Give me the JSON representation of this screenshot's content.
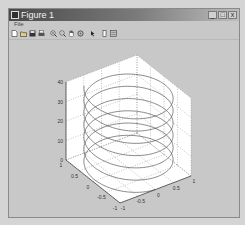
{
  "window": {
    "title": "Figure 1",
    "controls": {
      "minimize": "_",
      "maximize": "□",
      "close": "x"
    }
  },
  "menu": {
    "items": [
      {
        "label": "File"
      }
    ]
  },
  "toolbar": {
    "buttons": [
      {
        "name": "new-figure",
        "icon": "new-file-icon"
      },
      {
        "name": "open-file",
        "icon": "open-folder-icon"
      },
      {
        "name": "save-figure",
        "icon": "save-icon"
      },
      {
        "name": "print-figure",
        "icon": "print-icon"
      },
      {
        "name": "zoom-in",
        "icon": "zoom-in-icon"
      },
      {
        "name": "zoom-out",
        "icon": "zoom-out-icon"
      },
      {
        "name": "pan",
        "icon": "hand-icon"
      },
      {
        "name": "rotate-3d",
        "icon": "rotate-icon"
      },
      {
        "name": "data-cursor",
        "icon": "arrow-cursor-icon"
      },
      {
        "name": "insert-colorbar",
        "icon": "colorbar-icon"
      },
      {
        "name": "insert-legend",
        "icon": "legend-icon"
      }
    ]
  },
  "chart_data": {
    "type": "line",
    "subtype": "3d-helix",
    "title": "",
    "xlabel": "",
    "ylabel": "",
    "zlabel": "",
    "xlim": [
      -1,
      1
    ],
    "ylim": [
      -1,
      1
    ],
    "zlim": [
      0,
      40
    ],
    "x_ticks": [
      "-1",
      "-0.5",
      "0",
      "0.5",
      "1"
    ],
    "y_ticks": [
      "-1",
      "-0.5",
      "0",
      "0.5",
      "1"
    ],
    "z_ticks": [
      "0",
      "10",
      "20",
      "30",
      "40"
    ],
    "grid": true,
    "legend": null,
    "series": [
      {
        "name": "helix",
        "x": "sin(t)",
        "y": "cos(t)",
        "z": "t",
        "t_range": [
          0,
          40
        ],
        "color": "#555555"
      }
    ]
  },
  "colors": {
    "line": "#555555",
    "axes_bg": "#ffffff",
    "figure_bg": "#c8c8c8",
    "grid": "#777777"
  }
}
